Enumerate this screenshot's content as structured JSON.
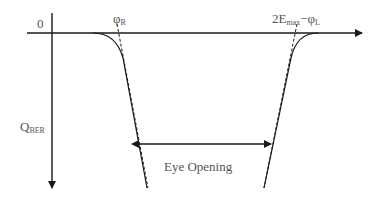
{
  "diagram": {
    "labels": {
      "origin": "0",
      "phi_r_main": "φ",
      "phi_r_sub": "R",
      "right_main1": "2E",
      "right_sub1": "max",
      "right_main2": "−φ",
      "right_sub2": "L",
      "y_axis_main": "Q",
      "y_axis_sub": "BER",
      "eye_opening": "Eye Opening"
    },
    "colors": {
      "line": "#1a1a1a",
      "text": "#555555"
    }
  }
}
